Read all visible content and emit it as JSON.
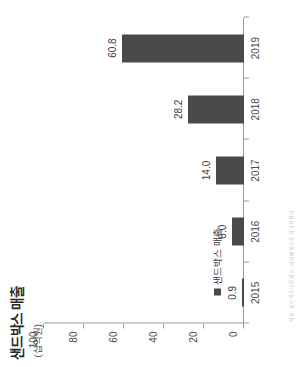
{
  "chart": {
    "title": "샌드박스 매출",
    "unit_label": "(십억원)",
    "legend_label": "샌드박스 매출",
    "source_note": "자료: 샌드박스네트워크, 미래에셋대우 리서치센터"
  },
  "chart_data": {
    "type": "bar",
    "title": "샌드박스 매출",
    "xlabel": "",
    "ylabel": "(십억원)",
    "categories": [
      "2015",
      "2016",
      "2017",
      "2018",
      "2019"
    ],
    "values": [
      0.9,
      6.0,
      14.0,
      28.2,
      60.8
    ],
    "value_labels": [
      "0.9",
      "6.0",
      "14.0",
      "28.2",
      "60.8"
    ],
    "series": [
      {
        "name": "샌드박스 매출",
        "values": [
          0.9,
          6.0,
          14.0,
          28.2,
          60.8
        ]
      }
    ],
    "ylim": [
      0,
      100
    ],
    "yticks": [
      0,
      20,
      40,
      60,
      80,
      100
    ],
    "ytick_labels": [
      "0",
      "20",
      "40",
      "60",
      "80",
      "100"
    ],
    "grid": false,
    "legend_position": "inside-bottom-left",
    "bar_color": "#4a4a4a",
    "axis_color": "#9a9a9a",
    "text_color": "#3c3c3c",
    "background": "#ffffff",
    "rotation_deg": -90
  }
}
